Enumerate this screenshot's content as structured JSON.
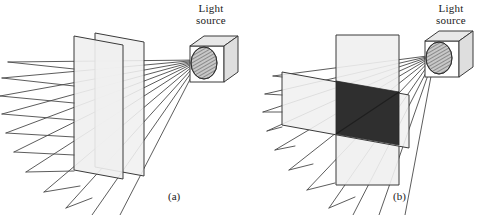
{
  "figure": {
    "background_color": "#ffffff",
    "width": 487,
    "height": 215,
    "panels": [
      {
        "id": "a",
        "caption": "(a)",
        "source_label": "Light\nsource",
        "state": "parallel-filters-light-transmitted",
        "overlap_fill": "#f2f2f2",
        "filter_fill": "#f0f0f0",
        "filter_stroke": "#3a3a3a",
        "ray_color": "#4a4a4a",
        "ray_count": 11
      },
      {
        "id": "b",
        "caption": "(b)",
        "source_label": "Light\nsource",
        "state": "crossed-filters-light-blocked",
        "overlap_fill": "#2f2f2f",
        "filter_fill": "#f0f0f0",
        "filter_stroke": "#3a3a3a",
        "ray_color": "#4a4a4a",
        "ray_count": 11
      }
    ],
    "colors": {
      "filter_light_gray": "#f0f0f0",
      "overlap_dark": "#2f2f2f",
      "outline": "#3a3a3a",
      "ray": "#4a4a4a",
      "text": "#1a1a1a",
      "source_box_face": "#ffffff",
      "source_box_top": "#e8e8e8",
      "source_box_side": "#dedede",
      "aperture_hatch": "#555555"
    }
  }
}
